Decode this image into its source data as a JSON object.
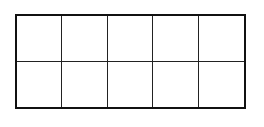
{
  "diagram": {
    "type": "ten-frame",
    "rows": 2,
    "columns": 5,
    "cells": [
      {
        "row": 0,
        "col": 0,
        "filled": false
      },
      {
        "row": 0,
        "col": 1,
        "filled": false
      },
      {
        "row": 0,
        "col": 2,
        "filled": false
      },
      {
        "row": 0,
        "col": 3,
        "filled": false
      },
      {
        "row": 0,
        "col": 4,
        "filled": false
      },
      {
        "row": 1,
        "col": 0,
        "filled": false
      },
      {
        "row": 1,
        "col": 1,
        "filled": false
      },
      {
        "row": 1,
        "col": 2,
        "filled": false
      },
      {
        "row": 1,
        "col": 3,
        "filled": false
      },
      {
        "row": 1,
        "col": 4,
        "filled": false
      }
    ],
    "colors": {
      "border": "#111111",
      "grid_line": "#222222",
      "background": "#ffffff"
    }
  }
}
